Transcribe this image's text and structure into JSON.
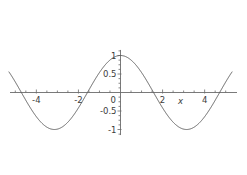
{
  "chart_data": {
    "type": "line",
    "title": "",
    "subtitle": "",
    "xlabel": "x",
    "ylabel": "",
    "function": "cos(x)",
    "xlim": [
      -5.3,
      5.3
    ],
    "ylim": [
      -1.15,
      1.15
    ],
    "grid": false,
    "legend": false,
    "legend_position": "none",
    "axis_style": "centered-cross",
    "curve_color": "#5a5a5a",
    "axis_color": "#6b6b6b",
    "background_color": "#ffffff",
    "x_ticks_major": [
      -4,
      -2,
      0,
      2,
      4
    ],
    "x_tick_labels": [
      "-4",
      "-2",
      "0",
      "2",
      "4"
    ],
    "x_ticks_minor_step": 0.5,
    "y_ticks_major": [
      1,
      0.5,
      -0.5,
      -1
    ],
    "y_tick_labels": [
      "1",
      "0.5",
      "-0.5",
      "-1"
    ],
    "y_ticks_minor_step": 0.125,
    "x": [
      -5.3,
      -5.1,
      -4.9,
      -4.7,
      -4.5,
      -4.3,
      -4.1,
      -3.9,
      -3.7,
      -3.5,
      -3.3,
      -3.1,
      -2.9,
      -2.7,
      -2.5,
      -2.3,
      -2.1,
      -1.9,
      -1.7,
      -1.5,
      -1.3,
      -1.1,
      -0.9,
      -0.7,
      -0.5,
      -0.3,
      -0.1,
      0.1,
      0.3,
      0.5,
      0.7,
      0.9,
      1.1,
      1.3,
      1.5,
      1.7,
      1.9,
      2.1,
      2.3,
      2.5,
      2.7,
      2.9,
      3.1,
      3.3,
      3.5,
      3.7,
      3.9,
      4.1,
      4.3,
      4.5,
      4.7,
      4.9,
      5.1,
      5.3
    ],
    "y": [
      0.554,
      0.378,
      0.187,
      -0.012,
      -0.211,
      -0.401,
      -0.574,
      -0.726,
      -0.848,
      -0.936,
      -0.987,
      -0.999,
      -0.971,
      -0.904,
      -0.801,
      -0.666,
      -0.505,
      -0.323,
      -0.129,
      0.071,
      0.268,
      0.454,
      0.622,
      0.765,
      0.878,
      0.955,
      0.995,
      0.995,
      0.955,
      0.878,
      0.765,
      0.622,
      0.454,
      0.268,
      0.071,
      -0.129,
      -0.323,
      -0.505,
      -0.666,
      -0.801,
      -0.904,
      -0.971,
      -0.999,
      -0.987,
      -0.936,
      -0.848,
      -0.726,
      -0.574,
      -0.401,
      -0.211,
      -0.012,
      0.187,
      0.378,
      0.554
    ],
    "maxima": [
      {
        "x": 0,
        "y": 1
      }
    ],
    "minima": [
      {
        "x": -3.1416,
        "y": -1
      },
      {
        "x": 3.1416,
        "y": -1
      }
    ],
    "zero_crossings": [
      -4.712,
      -1.571,
      1.571,
      4.712
    ]
  }
}
